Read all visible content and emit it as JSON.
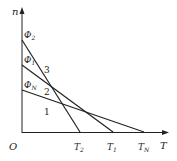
{
  "axes": {
    "y_label": "n",
    "x_label": "T",
    "origin_label": "O"
  },
  "y_ticks": [
    {
      "label": "Φ",
      "sub": "2",
      "y": 40
    },
    {
      "label": "Φ",
      "sub": "1",
      "y": 65
    },
    {
      "label": "Φ",
      "sub": "N",
      "y": 90
    }
  ],
  "x_ticks": [
    {
      "label": "T",
      "sub": "2",
      "x": 80
    },
    {
      "label": "T",
      "sub": "1",
      "x": 113
    },
    {
      "label": "T",
      "sub": "N",
      "x": 144
    }
  ],
  "lines": [
    {
      "id": "3",
      "from": [
        22,
        40
      ],
      "to": [
        80,
        132
      ]
    },
    {
      "id": "2",
      "from": [
        22,
        65
      ],
      "to": [
        113,
        132
      ]
    },
    {
      "id": "1",
      "from": [
        22,
        90
      ],
      "to": [
        144,
        132
      ]
    }
  ],
  "region_labels": [
    {
      "text": "3",
      "x": 44,
      "y": 73
    },
    {
      "text": "2",
      "x": 44,
      "y": 95
    },
    {
      "text": "1",
      "x": 44,
      "y": 115
    }
  ],
  "colors": {
    "stroke": "#222222"
  }
}
